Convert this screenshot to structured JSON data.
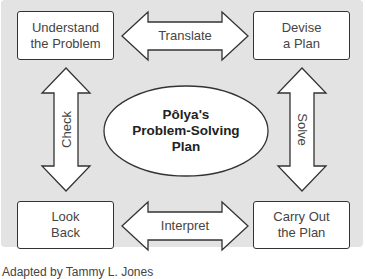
{
  "diagram": {
    "title": "Pôlya's\nProblem-Solving\nPlan",
    "steps": [
      {
        "id": "understand",
        "label": "Understand\nthe Problem"
      },
      {
        "id": "devise",
        "label": "Devise\na Plan"
      },
      {
        "id": "carry-out",
        "label": "Carry Out\nthe Plan"
      },
      {
        "id": "look-back",
        "label": "Look\nBack"
      }
    ],
    "arrows": [
      {
        "id": "translate",
        "label": "Translate",
        "from": "understand",
        "to": "devise",
        "direction": "both"
      },
      {
        "id": "solve",
        "label": "Solve",
        "from": "devise",
        "to": "carry-out",
        "direction": "both"
      },
      {
        "id": "interpret",
        "label": "Interpret",
        "from": "carry-out",
        "to": "look-back",
        "direction": "both"
      },
      {
        "id": "check",
        "label": "Check",
        "from": "look-back",
        "to": "understand",
        "direction": "both"
      }
    ],
    "footer": "Adapted by Tammy L. Jones"
  },
  "colors": {
    "background": "#e3e3e3",
    "box_fill": "#ffffff",
    "stroke": "#333333",
    "text": "#444444"
  }
}
